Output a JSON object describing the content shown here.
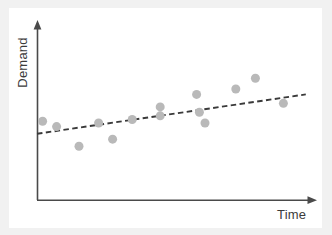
{
  "chart_data": {
    "type": "scatter",
    "title": "",
    "xlabel": "Time",
    "ylabel": "Demand",
    "xlim": [
      0,
      100
    ],
    "ylim": [
      0,
      100
    ],
    "grid": false,
    "legend": "none",
    "axis_style": "arrow-axes-no-ticks",
    "series": [
      {
        "name": "Demand observations",
        "type": "scatter",
        "color": "#b9b9b9",
        "marker_size": 9,
        "points": [
          {
            "x": 2,
            "y": 44
          },
          {
            "x": 7,
            "y": 41
          },
          {
            "x": 15,
            "y": 30
          },
          {
            "x": 22,
            "y": 43
          },
          {
            "x": 27,
            "y": 34
          },
          {
            "x": 34,
            "y": 45
          },
          {
            "x": 44,
            "y": 47
          },
          {
            "x": 44,
            "y": 52
          },
          {
            "x": 57,
            "y": 59
          },
          {
            "x": 58,
            "y": 49
          },
          {
            "x": 60,
            "y": 43
          },
          {
            "x": 71,
            "y": 62
          },
          {
            "x": 78,
            "y": 68
          },
          {
            "x": 88,
            "y": 54
          }
        ]
      },
      {
        "name": "Linear trend",
        "type": "line",
        "style": "dashed",
        "color": "#3a3a3a",
        "start": {
          "x": 0,
          "y": 37
        },
        "end": {
          "x": 96,
          "y": 59
        }
      }
    ],
    "annotations": []
  },
  "labels": {
    "y_axis": "Demand",
    "x_axis": "Time"
  },
  "colors": {
    "point": "#b9b9b9",
    "trend": "#3a3a3a",
    "axis": "#4a4a4a",
    "plot_background": "#ffffff",
    "page_margin": "#f1f1f1",
    "label_text": "#3b3b3b"
  }
}
